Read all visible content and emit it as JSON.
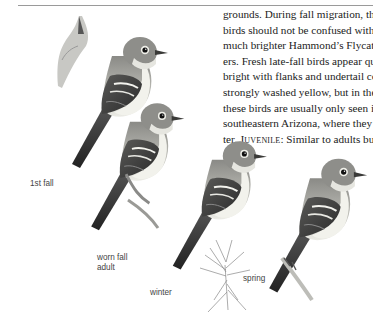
{
  "page": {
    "body_text_lines": [
      "grounds. During fall migration, these",
      "birds should not be confused with the",
      "much brighter Hammond’s Flycatch-",
      "ers. Fresh late-fall birds appear quite",
      "bright with flanks and undertail coverts",
      "strongly washed yellow, but in the U.S.",
      "these birds are usually only seen in",
      "southeastern Arizona, where they win-"
    ],
    "last_line": {
      "prefix": "ter. ",
      "heading": "Juvenile",
      "suffix": ": Similar to adults but"
    }
  },
  "illustration": {
    "labels": {
      "first_fall": "1st fall",
      "worn_fall_adult_line1": "worn fall",
      "worn_fall_adult_line2": "adult",
      "winter": "winter",
      "spring": "spring"
    }
  }
}
